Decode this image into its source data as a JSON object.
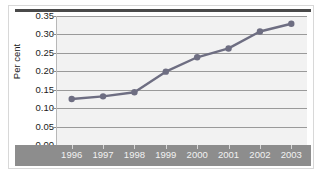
{
  "chart_data": {
    "type": "line",
    "title": "",
    "xlabel": "",
    "ylabel": "Per cent",
    "categories": [
      "1996",
      "1997",
      "1998",
      "1999",
      "2000",
      "2001",
      "2002",
      "2003"
    ],
    "values": [
      0.125,
      0.132,
      0.143,
      0.199,
      0.238,
      0.262,
      0.308,
      0.329
    ],
    "series": [
      {
        "name": "Per cent",
        "values": [
          0.125,
          0.132,
          0.143,
          0.199,
          0.238,
          0.262,
          0.308,
          0.329
        ]
      }
    ],
    "ylim": [
      0.0,
      0.35
    ],
    "ytick_labels": [
      "0.35",
      "0.30",
      "0.25",
      "0.20",
      "0.15",
      "0.10",
      "0.05",
      "0.00"
    ],
    "ytick_values": [
      0.35,
      0.3,
      0.25,
      0.2,
      0.15,
      0.1,
      0.05,
      0.0
    ],
    "ytick_step": 0.05,
    "grid": true,
    "legend": "none",
    "marker": "circle",
    "colors": {
      "line": "#6e6e82",
      "marker": "#6e6e82",
      "plot_background": "#f2f2f2",
      "gridline": "#9a9a9a",
      "x_band": "#8d8d8d",
      "x_label_text": "#f2f2f2",
      "y_label_text": "#1a1a1a",
      "top_rule": "#4a4a4a",
      "frame": "#d8d8d8"
    }
  }
}
